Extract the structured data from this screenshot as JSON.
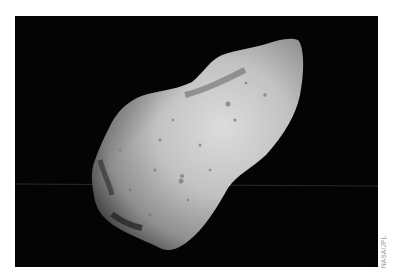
{
  "figure": {
    "credit": "NASA/JPL",
    "colors": {
      "background": "#ffffff",
      "space": "#040404",
      "surface_light": "#d8d8d8",
      "surface_mid": "#a8a8a8",
      "surface_dark": "#3a3a3a"
    }
  }
}
